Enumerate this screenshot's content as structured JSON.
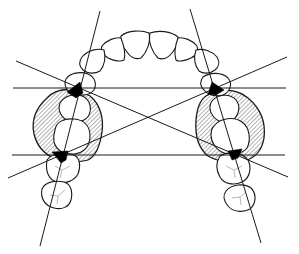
{
  "diagram": {
    "colors": {
      "ink": "#1a1a1a",
      "contact_fill": "#000000",
      "background": "#ffffff",
      "hatch": "#555555"
    },
    "elements": {
      "teeth": [
        {
          "name": "central-incisor-left"
        },
        {
          "name": "central-incisor-right"
        },
        {
          "name": "lateral-incisor-left"
        },
        {
          "name": "lateral-incisor-right"
        },
        {
          "name": "canine-left"
        },
        {
          "name": "canine-right"
        },
        {
          "name": "first-premolar-left"
        },
        {
          "name": "first-premolar-right"
        },
        {
          "name": "second-premolar-left"
        },
        {
          "name": "second-premolar-right"
        },
        {
          "name": "first-molar-left"
        },
        {
          "name": "first-molar-right"
        },
        {
          "name": "second-molar-left"
        },
        {
          "name": "second-molar-right"
        }
      ],
      "hatched_regions": [
        "left-premolar-segment",
        "right-premolar-segment"
      ],
      "contact_points": [
        "left-upper",
        "left-lower",
        "right-upper",
        "right-lower"
      ],
      "reference_lines": [
        "upper-horizontal",
        "lower-horizontal",
        "left-long-axis",
        "right-long-axis",
        "diagonal-left-to-right",
        "diagonal-right-to-left"
      ]
    }
  }
}
